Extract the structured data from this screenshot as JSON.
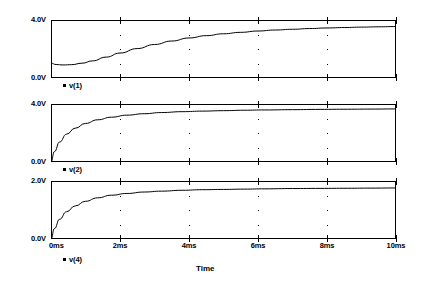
{
  "chart_data": {
    "type": "line",
    "title": "",
    "xlabel": "Time",
    "x_unit": "ms",
    "xlim": [
      0,
      10
    ],
    "xticks": [
      0,
      2,
      4,
      6,
      8,
      10
    ],
    "xtick_labels": [
      "0ms",
      "2ms",
      "4ms",
      "6ms",
      "8ms",
      "10ms"
    ],
    "grid": "dotted-interior-ticks",
    "legend_position": "below-each-panel-left",
    "panels": [
      {
        "name": "panel-v1",
        "ylabel": "",
        "ylim": [
          0.0,
          4.0
        ],
        "ytick_labels": [
          "4.0V",
          "0.0V"
        ],
        "ytick_top": "4.0V",
        "ytick_bottom": "0.0V",
        "legend": "v(1)",
        "series": [
          {
            "name": "v(1)",
            "x": [
              0.0,
              0.15,
              0.35,
              0.6,
              0.9,
              1.2,
              1.6,
              2.0,
              2.5,
              3.0,
              3.5,
              4.0,
              4.5,
              5.0,
              5.5,
              6.0,
              6.5,
              7.0,
              7.5,
              8.0,
              8.5,
              9.0,
              9.5,
              10.0
            ],
            "y": [
              1.02,
              0.93,
              0.9,
              0.92,
              1.02,
              1.18,
              1.44,
              1.72,
              2.03,
              2.31,
              2.55,
              2.76,
              2.92,
              3.05,
              3.15,
              3.24,
              3.31,
              3.36,
              3.41,
              3.45,
              3.48,
              3.51,
              3.53,
              3.55
            ]
          }
        ]
      },
      {
        "name": "panel-v2",
        "ylabel": "",
        "ylim": [
          0.0,
          4.0
        ],
        "ytick_labels": [
          "4.0V",
          "0.0V"
        ],
        "ytick_top": "4.0V",
        "ytick_bottom": "0.0V",
        "legend": "v(2)",
        "series": [
          {
            "name": "v(2)",
            "x": [
              0.0,
              0.1,
              0.25,
              0.45,
              0.7,
              1.0,
              1.35,
              1.75,
              2.2,
              2.7,
              3.2,
              3.8,
              4.4,
              5.0,
              5.6,
              6.2,
              7.0,
              7.8,
              8.6,
              9.3,
              10.0
            ],
            "y": [
              0.0,
              0.72,
              1.38,
              1.92,
              2.33,
              2.66,
              2.91,
              3.09,
              3.23,
              3.33,
              3.41,
              3.47,
              3.51,
              3.54,
              3.57,
              3.59,
              3.61,
              3.63,
              3.64,
              3.65,
              3.66
            ]
          }
        ]
      },
      {
        "name": "panel-v4",
        "ylabel": "",
        "ylim": [
          0.0,
          2.0
        ],
        "ytick_labels": [
          "2.0V",
          "0.0V"
        ],
        "ytick_top": "2.0V",
        "ytick_bottom": "0.0V",
        "legend": "v(4)",
        "series": [
          {
            "name": "v(4)",
            "x": [
              0.0,
              0.1,
              0.25,
              0.45,
              0.7,
              1.0,
              1.35,
              1.75,
              2.2,
              2.7,
              3.2,
              3.8,
              4.4,
              5.0,
              5.6,
              6.2,
              7.0,
              7.8,
              8.6,
              9.3,
              10.0
            ],
            "y": [
              0.0,
              0.36,
              0.68,
              0.94,
              1.14,
              1.3,
              1.42,
              1.51,
              1.57,
              1.62,
              1.65,
              1.68,
              1.7,
              1.71,
              1.72,
              1.73,
              1.74,
              1.745,
              1.75,
              1.755,
              1.76
            ]
          }
        ]
      }
    ],
    "colors": {
      "trace": "#000000",
      "axis": "#000000",
      "background": "#ffffff"
    }
  }
}
